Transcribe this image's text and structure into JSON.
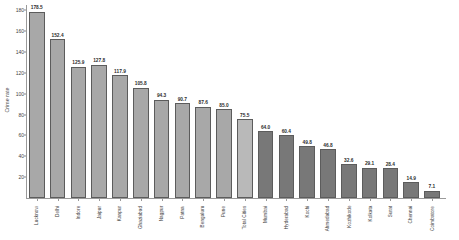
{
  "chart_data": {
    "type": "bar",
    "title": "",
    "subtitle": "",
    "xlabel": "",
    "ylabel": "Crime rate",
    "ylim": [
      0,
      190
    ],
    "grid": false,
    "legend": null,
    "categories": [
      "Lucknow",
      "Delhi",
      "Indore",
      "Jaipur",
      "Kanpur",
      "Ghaziabad",
      "Nagpur",
      "Patna",
      "Bengaluru",
      "Pune",
      "Total Cities",
      "Mumbai",
      "Hyderabad",
      "Kochi",
      "Ahmedabad",
      "Kozhikode",
      "Kolkata",
      "Surat",
      "Chennai",
      "Coimbatore"
    ],
    "values": [
      178.5,
      152.4,
      125.9,
      127.8,
      117.9,
      105.8,
      94.3,
      90.7,
      87.6,
      85.0,
      75.5,
      64.0,
      60.4,
      49.8,
      46.8,
      32.6,
      29.1,
      28.4,
      14.9,
      7.1
    ],
    "value_labels": [
      "178.5",
      "152.4",
      "125.9",
      "127.8",
      "117.9",
      "105.8",
      "94.3",
      "90.7",
      "87.6",
      "85.0",
      "75.5",
      "64.0",
      "60.4",
      "49.8",
      "46.8",
      "32.6",
      "29.1",
      "28.4",
      "14.9",
      "7.1"
    ],
    "bar_colors": [
      "#a8a8a8",
      "#a8a8a8",
      "#a8a8a8",
      "#a8a8a8",
      "#a8a8a8",
      "#a8a8a8",
      "#a8a8a8",
      "#a8a8a8",
      "#a8a8a8",
      "#a8a8a8",
      "#b9b9b9",
      "#787878",
      "#787878",
      "#787878",
      "#787878",
      "#787878",
      "#787878",
      "#787878",
      "#787878",
      "#787878"
    ],
    "y_ticks": [
      20,
      40,
      60,
      80,
      100,
      120,
      140,
      160,
      180
    ],
    "y_tick_labels": [
      "20",
      "40",
      "60",
      "80",
      "100",
      "120",
      "140",
      "160",
      "180"
    ]
  }
}
